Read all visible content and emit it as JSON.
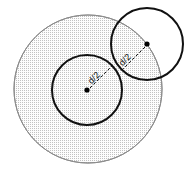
{
  "figure": {
    "background_color": "#ffffff",
    "width": 191,
    "height": 174,
    "shapes": {
      "outer_circle": {
        "name": "large-stippled-circle",
        "cx": 88,
        "cy": 89,
        "r": 74,
        "stroke_color": "#8a8a8a",
        "stroke_width": 1,
        "fill": "stippled-dot-pattern",
        "fill_color": "#b9b9b9",
        "fill_background": "#fdfdfd"
      },
      "center_circle": {
        "name": "center-circle",
        "cx": 87,
        "cy": 90,
        "r": 35,
        "stroke_color": "#111111",
        "stroke_width": 2,
        "fill": "none"
      },
      "upper_right_circle": {
        "name": "upper-right-circle",
        "cx": 147,
        "cy": 44,
        "r": 36,
        "stroke_color": "#111111",
        "stroke_width": 2,
        "fill": "none"
      }
    },
    "center_dots": [
      {
        "name": "center-circle-center-dot",
        "cx": 87,
        "cy": 90,
        "r": 2.6,
        "color": "#000000"
      },
      {
        "name": "upper-right-circle-center-dot",
        "cx": 147,
        "cy": 44,
        "r": 2.6,
        "color": "#000000"
      }
    ],
    "radius_lines": [
      {
        "name": "center-circle-radius-leader",
        "x1": 90,
        "y1": 88,
        "x2": 112,
        "y2": 66,
        "stroke_color": "#111111",
        "stroke_width": 1,
        "dash": "3,2"
      },
      {
        "name": "upper-right-circle-radius-leader",
        "x1": 145,
        "y1": 47,
        "x2": 122,
        "y2": 70,
        "stroke_color": "#111111",
        "stroke_width": 1,
        "dash": "3,2"
      }
    ],
    "labels": [
      {
        "name": "center-circle-radius-label",
        "text": "d/2",
        "x": 96,
        "y": 80,
        "rotation": -45
      },
      {
        "name": "upper-right-circle-radius-label",
        "text": "d/2",
        "x": 127,
        "y": 62,
        "rotation": -45
      }
    ]
  }
}
